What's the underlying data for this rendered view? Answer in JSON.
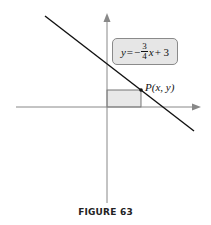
{
  "figure": {
    "caption": "FIGURE 63",
    "equation": {
      "lhs": "y",
      "equals": "=",
      "sign": "−",
      "numerator": "3",
      "denominator": "4",
      "var": "x",
      "rest": "+ 3",
      "full_text": "y = −3/4 x + 3"
    },
    "point_label": {
      "name": "P",
      "coords": "(x, y)",
      "full_text": "P(x, y)"
    },
    "colors": {
      "axis": "#888888",
      "line": "#111111",
      "rect_fill": "#e8e8e8",
      "box_fill": "#e6e6e6"
    }
  }
}
